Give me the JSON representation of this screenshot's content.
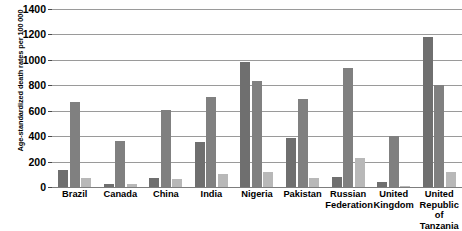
{
  "chart_data": {
    "type": "bar",
    "title": "",
    "xlabel": "",
    "ylabel": "Age-standardized death rates per 100 000",
    "ylim": [
      0,
      1400
    ],
    "yticks": [
      0,
      200,
      400,
      600,
      800,
      1000,
      1200,
      1400
    ],
    "ytick_labels": [
      "0",
      "200",
      "400",
      "600",
      "800",
      "1000",
      "1200",
      "1400"
    ],
    "grid": true,
    "legend": "none",
    "categories": [
      "Brazil",
      "Canada",
      "China",
      "India",
      "Nigeria",
      "Pakistan",
      "Russian\nFederation",
      "United\nKingdom",
      "United\nRepublic\nof Tanzania"
    ],
    "series": [
      {
        "name": "series-1",
        "color": "#6f6f6f",
        "values": [
          135,
          20,
          70,
          355,
          985,
          385,
          75,
          40,
          1180
        ]
      },
      {
        "name": "series-2",
        "color": "#808080",
        "values": [
          670,
          360,
          605,
          710,
          830,
          690,
          935,
          405,
          800
        ]
      },
      {
        "name": "series-3",
        "color": "#b8b8b8",
        "values": [
          70,
          20,
          65,
          105,
          120,
          70,
          230,
          8,
          120
        ]
      }
    ]
  }
}
